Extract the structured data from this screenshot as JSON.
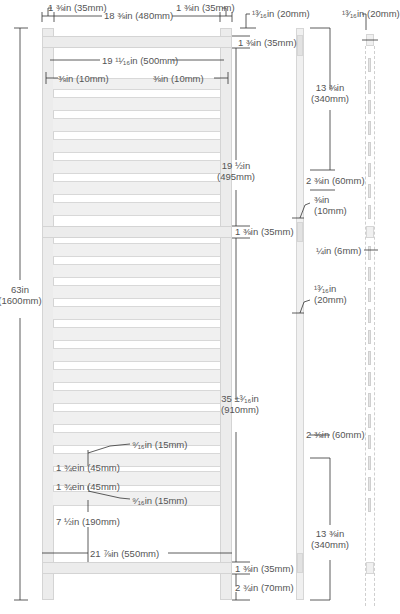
{
  "diagram": {
    "colors": {
      "wood": "#ececec",
      "outline": "#d4d4d4",
      "dimension_line": "#333333",
      "text": "#555555"
    },
    "front_view": {
      "post_width_left": "1 ⅜in (35mm)",
      "post_width_right": "1 ⅜in (35mm)",
      "inner_width": "18 ⅜in (480mm)",
      "slat_length": "19 ¹¹⁄₁₆in (500mm)",
      "slat_overhang_left": "⅜in (10mm)",
      "slat_overhang_right": "⅜in (10mm)",
      "top_rail": "1 ⅜in (35mm)",
      "upper_section": {
        "line1": "19 ½in",
        "line2": "(495mm)"
      },
      "middle_rail": "1 ⅜in (35mm)",
      "lower_section": {
        "line1": "35 ±³⁄₁₆in",
        "line2": "(910mm)"
      },
      "total_height": {
        "line1": "63in",
        "line2": "(1600mm)"
      },
      "slat_gap_top": "⁹⁄₁₆in (15mm)",
      "slat_height_1": "1 ¾ein (45mm)",
      "slat_height_2": "1 ¾ein (45mm)",
      "slat_gap_bottom": "⁹⁄₁₆in (15mm)",
      "bottom_gap": "7 ½in (190mm)",
      "overall_width": "21 ⅞in (550mm)",
      "bottom_rail": "1 ⅜in (35mm)",
      "foot": "2 ¾in (70mm)"
    },
    "side_view": {
      "post_depth": "¹³⁄₁₆in (20mm)",
      "upper_span": {
        "line1": "13 ⅜in",
        "line2": "(340mm)"
      },
      "upper_slot": "2 ⅜in (60mm)",
      "groove": {
        "line1": "⅜in",
        "line2": "(10mm)"
      },
      "rail_depth": {
        "line1": "¹³⁄₁₆in",
        "line2": "(20mm)"
      },
      "lower_slot": "2 ⅜in (60mm)",
      "lower_span": {
        "line1": "13 ⅜in",
        "line2": "(340mm)"
      }
    },
    "slat_view": {
      "slat_depth": "¹³⁄₁₆in (20mm)",
      "slat_thickness": "¼in (6mm)"
    }
  }
}
